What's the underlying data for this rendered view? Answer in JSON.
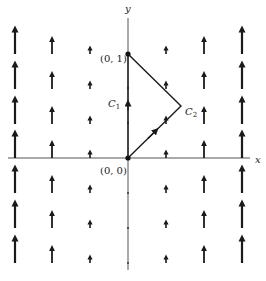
{
  "figure": {
    "type": "vector-field-with-path",
    "axes": {
      "x_label": "x",
      "y_label": "y"
    },
    "points": [
      {
        "label": "(0, 0)",
        "x": 0,
        "y": 0
      },
      {
        "label": "(0, 1)",
        "x": 0,
        "y": 1
      }
    ],
    "curves": [
      {
        "label": "C",
        "sub": "1",
        "description": "segment along y-axis from (0,0) to (0,1)"
      },
      {
        "label": "C",
        "sub": "2",
        "description": "two segments from (0,0) to corner and back to (0,1)"
      }
    ],
    "vector_field": {
      "direction": "up",
      "columns_x": [
        -3,
        -2,
        -1,
        1,
        2,
        3
      ],
      "rows_count": 7,
      "magnitude_grows_with": "|x|"
    },
    "colors": {
      "ink": "#1a1a1a",
      "axis": "#555555",
      "background": "#ffffff"
    }
  }
}
